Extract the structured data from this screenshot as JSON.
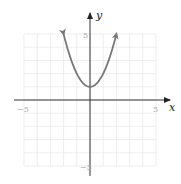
{
  "chart_data": {
    "type": "line",
    "title": "",
    "xlabel": "x",
    "ylabel": "y",
    "xlim": [
      -5,
      5
    ],
    "ylim": [
      -5,
      5
    ],
    "grid": true,
    "tick_labels": {
      "x_min": "−5",
      "x_max": "5",
      "y_max": "5",
      "y_min": "−5"
    },
    "series": [
      {
        "name": "y = x^2 + 1",
        "equation": "y = x^2 + 1",
        "color": "#777777",
        "x": [
          -2,
          -1.5,
          -1,
          -0.5,
          0,
          0.5,
          1,
          1.5,
          2
        ],
        "y": [
          5,
          3.25,
          2,
          1.25,
          1,
          1.25,
          2,
          3.25,
          5
        ],
        "vertex": [
          0,
          1
        ],
        "arrows_at_ends": true
      }
    ]
  },
  "labels": {
    "x_axis": "x",
    "y_axis": "y",
    "x_tick_min": "−5",
    "x_tick_max": "5",
    "y_tick_max": "5",
    "y_tick_min": "−5"
  }
}
